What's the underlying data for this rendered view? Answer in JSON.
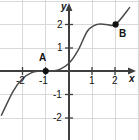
{
  "chart_data": {
    "type": "line",
    "title": "",
    "xlabel": "x",
    "ylabel": "y",
    "xlim": [
      -2.9,
      3.0
    ],
    "ylim": [
      -3.0,
      2.95
    ],
    "grid": true,
    "grid_spacing": 1,
    "legend": "none",
    "x_ticks": [
      -2,
      -1,
      1,
      2
    ],
    "x_tick_labels": [
      "-2",
      "-1",
      "1",
      "2"
    ],
    "y_ticks": [
      2,
      1,
      -1,
      -2
    ],
    "y_tick_labels": [
      "2",
      "1",
      "-1",
      "-2"
    ],
    "function_description": "cubic curve rising left to right, flat near x = -1",
    "curve_points": [
      {
        "x": -2.9,
        "y": -1.9
      },
      {
        "x": -2.4,
        "y": -0.87
      },
      {
        "x": -2.0,
        "y": -0.33
      },
      {
        "x": -1.6,
        "y": -0.07
      },
      {
        "x": -1.3,
        "y": -0.01
      },
      {
        "x": -1.0,
        "y": 0.0
      },
      {
        "x": -0.7,
        "y": 0.01
      },
      {
        "x": -0.4,
        "y": 0.07
      },
      {
        "x": 0.0,
        "y": 0.33
      },
      {
        "x": 0.4,
        "y": 0.91
      },
      {
        "x": 0.8,
        "y": 1.73
      },
      {
        "x": 1.2,
        "y": 2.0
      },
      {
        "x": 1.6,
        "y": 2.0
      },
      {
        "x": 2.0,
        "y": 2.0
      },
      {
        "x": 2.6,
        "y": 2.72
      }
    ],
    "annotations": [
      {
        "name": "A",
        "label": "A",
        "x": -1,
        "y": 0,
        "label_position": "above"
      },
      {
        "name": "B",
        "label": "B",
        "x": 2,
        "y": 2,
        "label_position": "below-right"
      }
    ],
    "colors": {
      "curve": "#4a4a4a",
      "axis": "#3a3a3a",
      "grid": "#d8d8d8",
      "point": "#111111",
      "text": "#111111",
      "background": "#ffffff"
    }
  },
  "axes": {
    "x_axis_label": "x",
    "y_axis_label": "y"
  },
  "ticks": {
    "x": [
      {
        "label": "-2",
        "left": 16,
        "top": 76
      },
      {
        "label": "-1",
        "left": 39,
        "top": 76
      },
      {
        "label": "1",
        "left": 90,
        "top": 76
      },
      {
        "label": "2",
        "left": 113,
        "top": 76
      }
    ],
    "y": [
      {
        "label": "2",
        "left": 57,
        "top": 20
      },
      {
        "label": "1",
        "left": 57,
        "top": 43
      },
      {
        "label": "-1",
        "left": 53,
        "top": 90
      },
      {
        "label": "-2",
        "left": 53,
        "top": 113
      }
    ]
  },
  "points": [
    {
      "name": "A",
      "label": "A",
      "cx": 45.5,
      "cy": 71,
      "label_left": 39,
      "label_top": 54
    },
    {
      "name": "B",
      "label": "B",
      "cx": 115,
      "cy": 24.5,
      "label_left": 119,
      "label_top": 30
    }
  ]
}
